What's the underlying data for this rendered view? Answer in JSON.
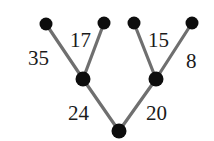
{
  "diagram": {
    "type": "weighted-binary-tree",
    "title": "",
    "colors": {
      "background": "#ffffff",
      "edge": "#6f6f6f",
      "node": "#0d0d0d",
      "label_text": "#1a1a1a"
    },
    "nodes": [
      {
        "id": "leaf1",
        "role": "leaf",
        "x": 46,
        "y": 24,
        "r": 6.5,
        "label": ""
      },
      {
        "id": "leaf2",
        "role": "leaf",
        "x": 104,
        "y": 23,
        "r": 6.5,
        "label": ""
      },
      {
        "id": "leaf3",
        "role": "leaf",
        "x": 134,
        "y": 23,
        "r": 6.5,
        "label": ""
      },
      {
        "id": "leaf4",
        "role": "leaf",
        "x": 192,
        "y": 23,
        "r": 6.5,
        "label": ""
      },
      {
        "id": "inner_left",
        "role": "internal",
        "x": 83,
        "y": 79,
        "r": 7.5,
        "label": ""
      },
      {
        "id": "inner_right",
        "role": "internal",
        "x": 156,
        "y": 79,
        "r": 7.5,
        "label": ""
      },
      {
        "id": "root",
        "role": "root",
        "x": 119,
        "y": 131,
        "r": 7.5,
        "label": ""
      }
    ],
    "edges": [
      {
        "id": "e35",
        "from": "leaf1",
        "to": "inner_left",
        "weight": "35"
      },
      {
        "id": "e17",
        "from": "leaf2",
        "to": "inner_left",
        "weight": "17"
      },
      {
        "id": "e15",
        "from": "leaf3",
        "to": "inner_right",
        "weight": "15"
      },
      {
        "id": "e8",
        "from": "leaf4",
        "to": "inner_right",
        "weight": "8"
      },
      {
        "id": "e24",
        "from": "inner_left",
        "to": "root",
        "weight": "24"
      },
      {
        "id": "e20",
        "from": "inner_right",
        "to": "root",
        "weight": "20"
      }
    ],
    "labels": [
      {
        "id": "label-35",
        "text": "35",
        "x": 28,
        "y": 48
      },
      {
        "id": "label-17",
        "text": "17",
        "x": 70,
        "y": 30
      },
      {
        "id": "label-15",
        "text": "15",
        "x": 148,
        "y": 30
      },
      {
        "id": "label-8",
        "text": "8",
        "x": 186,
        "y": 51
      },
      {
        "id": "label-24",
        "text": "24",
        "x": 68,
        "y": 103
      },
      {
        "id": "label-20",
        "text": "20",
        "x": 146,
        "y": 103
      }
    ]
  }
}
